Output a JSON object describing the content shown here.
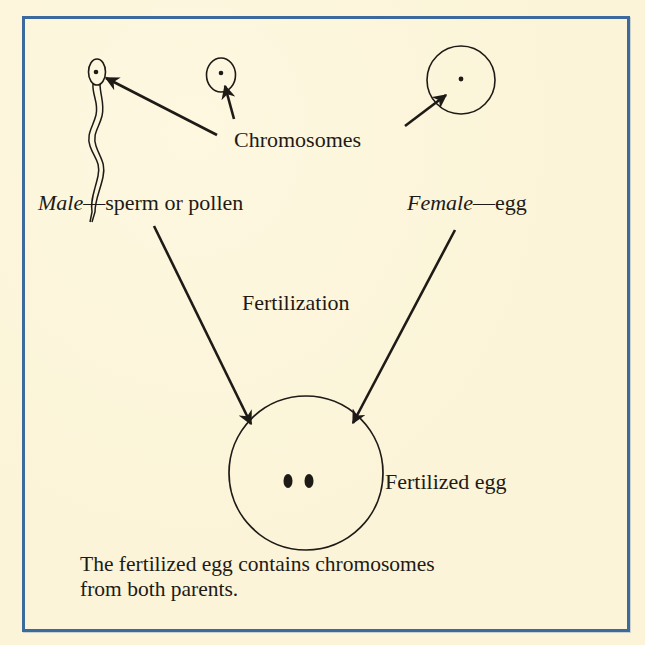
{
  "figure": {
    "type": "biology-diagram",
    "topic": "Fertilization",
    "colors": {
      "background": "#fbf4d8",
      "border": "#3d6a9e",
      "ink": "#1e1a16"
    }
  },
  "labels": {
    "chromosomes": "Chromosomes",
    "male_prefix": "Male",
    "male_suffix": "—sperm or pollen",
    "female_prefix": "Female",
    "female_suffix": "—egg",
    "fertilization": "Fertilization",
    "fertilized_egg": "Fertilized egg"
  },
  "caption": {
    "line1": "The fertilized egg contains chromosomes",
    "line2": "from both parents."
  },
  "nodes": [
    {
      "id": "sperm",
      "label": "Male — sperm",
      "chromosomes": 1
    },
    {
      "id": "pollen",
      "label": "Male — pollen",
      "chromosomes": 1
    },
    {
      "id": "egg",
      "label": "Female — egg",
      "chromosomes": 1
    },
    {
      "id": "fertilized-egg",
      "label": "Fertilized egg",
      "chromosomes": 2
    }
  ],
  "edges": [
    {
      "from": "chromosomes-label",
      "to": "sperm"
    },
    {
      "from": "chromosomes-label",
      "to": "pollen"
    },
    {
      "from": "chromosomes-label",
      "to": "egg"
    },
    {
      "from": "male",
      "to": "fertilized-egg",
      "label": "Fertilization"
    },
    {
      "from": "female",
      "to": "fertilized-egg",
      "label": "Fertilization"
    }
  ]
}
